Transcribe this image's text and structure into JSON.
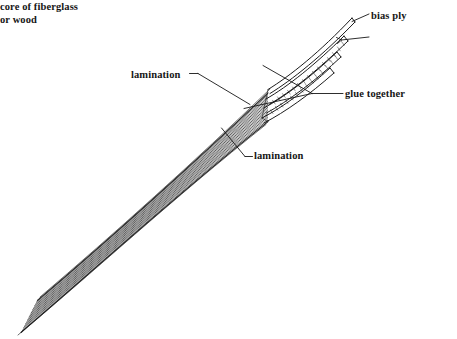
{
  "diagram": {
    "background_color": "#ffffff",
    "ink_color": "#1a1a1a",
    "labels": {
      "bias_ply": "bias ply",
      "core_line1": "core of fiberglass",
      "core_line2": "or wood",
      "glue_together": "glue together",
      "lamination_upper": "lamination",
      "lamination_lower": "lamination"
    },
    "leaders": [
      {
        "name": "bias-ply-leader",
        "from": [
          369,
          14
        ],
        "to": [
          351,
          22
        ]
      },
      {
        "name": "core-leader",
        "from": [
          369,
          37
        ],
        "to": [
          340,
          41
        ]
      },
      {
        "name": "glue-leader-main",
        "from": [
          343,
          93
        ],
        "to": [
          311,
          93
        ]
      },
      {
        "name": "glue-leader-branch-upper",
        "from": [
          311,
          93
        ],
        "to": [
          264,
          66
        ]
      },
      {
        "name": "glue-leader-branch-lower",
        "from": [
          311,
          93
        ],
        "to": [
          245,
          108
        ]
      },
      {
        "name": "lamination-upper-leader",
        "from": [
          190,
          74
        ],
        "to": [
          249,
          104
        ]
      },
      {
        "name": "lamination-lower-leader",
        "from": [
          252,
          157
        ],
        "to": [
          222,
          128
        ]
      }
    ],
    "laminate": {
      "description": "Curved bundle of thin laminations splaying apart at the upper right tip",
      "lamination_count": 17,
      "splayed_strips": 4,
      "curve_start": [
        22,
        331
      ],
      "curve_end": [
        352,
        18
      ]
    }
  }
}
